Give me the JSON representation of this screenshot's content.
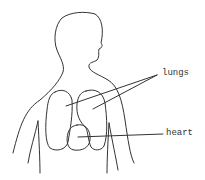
{
  "diagram": {
    "labels": [
      {
        "id": "lungs",
        "text": "lungs"
      },
      {
        "id": "heart",
        "text": "heart"
      }
    ],
    "colors": {
      "stroke": "#333333",
      "background": "#ffffff"
    }
  }
}
